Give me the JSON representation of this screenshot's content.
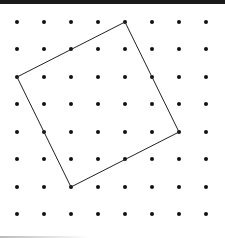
{
  "diagram": {
    "type": "dot-grid-geoboard",
    "grid": {
      "columns": 8,
      "rows": 8,
      "x_positions": [
        17,
        44,
        71,
        98,
        125,
        152,
        179,
        206
      ],
      "y_positions": [
        22,
        49,
        77,
        104,
        132,
        159,
        187,
        214
      ],
      "dot_radius": 2,
      "dot_color": "#111111"
    },
    "shape": {
      "name": "tilted-square",
      "vertices_grid": [
        {
          "col": 4,
          "row": 0,
          "label": "top"
        },
        {
          "col": 6,
          "row": 4,
          "label": "right"
        },
        {
          "col": 2,
          "row": 6,
          "label": "bottom"
        },
        {
          "col": 0,
          "row": 2,
          "label": "left"
        }
      ],
      "stroke_color": "#222222",
      "stroke_width": 1
    },
    "frame": {
      "top_border_color": "#1a1a1a"
    }
  }
}
